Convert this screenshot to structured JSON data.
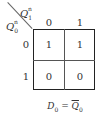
{
  "kmap": {
    "col_var": {
      "base": "Q",
      "sub": "1",
      "sup": "n"
    },
    "row_var": {
      "base": "Q",
      "sub": "0",
      "sup": "n"
    },
    "col_labels": [
      "0",
      "1"
    ],
    "row_labels": [
      "0",
      "1"
    ],
    "cells": [
      [
        "1",
        "1"
      ],
      [
        "0",
        "0"
      ]
    ]
  },
  "caption": {
    "lhs": "D",
    "lhs_sub": "0",
    "eq": " = ",
    "rhs": "Q",
    "rhs_sub": "0"
  }
}
